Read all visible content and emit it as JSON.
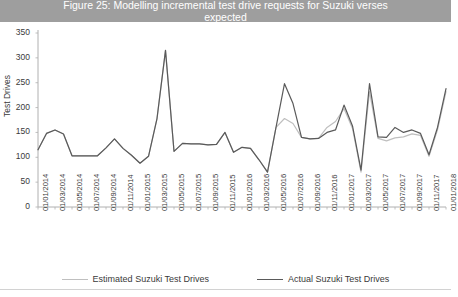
{
  "title": {
    "line1": "Figure 25: Modelling incremental test drive requests for Suzuki verses",
    "line2": "expected"
  },
  "legend": {
    "items": [
      {
        "label": "Estimated Suzuki Test Drives",
        "color": "#bfbfbf"
      },
      {
        "label": "Actual Suzuki Test Drives",
        "color": "#5a5a5a"
      }
    ]
  },
  "chart_data": {
    "type": "line",
    "title": "Figure 25: Modelling incremental test drive requests for Suzuki verses expected",
    "xlabel": "",
    "ylabel": "Test Drives",
    "ylim": [
      0,
      350
    ],
    "ytick_step": 50,
    "yticks": [
      "0",
      "50",
      "100",
      "150",
      "200",
      "250",
      "300",
      "350"
    ],
    "grid": false,
    "legend_position": "bottom",
    "x": [
      "01/01/2014",
      "01/02/2014",
      "01/03/2014",
      "01/04/2014",
      "01/05/2014",
      "01/06/2014",
      "01/07/2014",
      "01/08/2014",
      "01/09/2014",
      "01/10/2014",
      "01/11/2014",
      "01/12/2014",
      "01/01/2015",
      "01/02/2015",
      "01/03/2015",
      "01/04/2015",
      "01/05/2015",
      "01/06/2015",
      "01/07/2015",
      "01/08/2015",
      "01/09/2015",
      "01/10/2015",
      "01/11/2015",
      "01/12/2015",
      "01/01/2016",
      "01/02/2016",
      "01/03/2016",
      "01/04/2016",
      "01/05/2016",
      "01/06/2016",
      "01/07/2016",
      "01/08/2016",
      "01/09/2016",
      "01/10/2016",
      "01/11/2016",
      "01/12/2016",
      "01/01/2017",
      "01/02/2017",
      "01/03/2017",
      "01/04/2017",
      "01/05/2017",
      "01/06/2017",
      "01/07/2017",
      "01/08/2017",
      "01/09/2017",
      "01/10/2017",
      "01/11/2017",
      "01/12/2017",
      "01/01/2018"
    ],
    "xtick_labels": [
      "01/01/2014",
      "01/03/2014",
      "01/05/2014",
      "01/07/2014",
      "01/09/2014",
      "01/11/2014",
      "01/01/2015",
      "01/03/2015",
      "01/05/2015",
      "01/07/2015",
      "01/09/2015",
      "01/11/2015",
      "01/01/2016",
      "01/03/2016",
      "01/05/2016",
      "01/07/2016",
      "01/09/2016",
      "01/11/2016",
      "01/01/2017",
      "01/03/2017",
      "01/05/2017",
      "01/07/2017",
      "01/09/2017",
      "01/11/2017",
      "01/01/2018"
    ],
    "series": [
      {
        "name": "Actual Suzuki Test Drives",
        "color": "#5a5a5a",
        "width": 1.2,
        "values": [
          115,
          148,
          155,
          147,
          103,
          103,
          103,
          103,
          119,
          137,
          118,
          104,
          88,
          102,
          178,
          315,
          112,
          128,
          127,
          127,
          125,
          126,
          150,
          110,
          120,
          118,
          95,
          70,
          160,
          248,
          208,
          140,
          137,
          138,
          150,
          155,
          205,
          163,
          74,
          248,
          141,
          140,
          160,
          150,
          155,
          148,
          105,
          160,
          238
        ]
      },
      {
        "name": "Estimated Suzuki Test Drives",
        "color": "#bfbfbf",
        "width": 1.2,
        "values": [
          115,
          148,
          155,
          147,
          103,
          103,
          103,
          103,
          119,
          137,
          118,
          104,
          88,
          102,
          178,
          315,
          112,
          128,
          127,
          127,
          125,
          126,
          150,
          110,
          120,
          118,
          95,
          70,
          160,
          178,
          168,
          140,
          137,
          138,
          160,
          172,
          198,
          158,
          70,
          232,
          138,
          133,
          139,
          141,
          147,
          144,
          102,
          155,
          232
        ]
      }
    ],
    "annotations": []
  }
}
